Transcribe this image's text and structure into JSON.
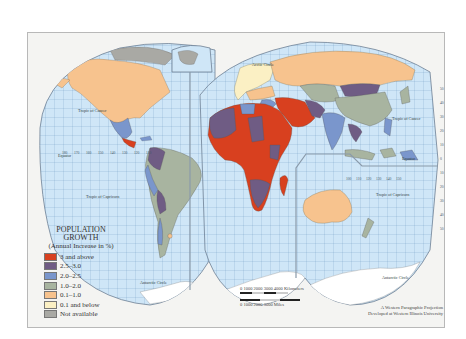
{
  "map": {
    "projection_credit": [
      "A Western Paragraphic Projection",
      "Developed at Western Illinois University"
    ],
    "colors": {
      "ocean": "#cfe6f7",
      "grid": "#6a95c0",
      "frame": "#b8b8b8",
      "not_available": "#a9a9a4",
      "3_and_above": "#d8401f",
      "2.5_3.0": "#6f5c84",
      "2.0_2.5": "#7a96cc",
      "1.0_2.0": "#a8b4a0",
      "0.1_1.0": "#f7c38e",
      "0.1_and_below": "#fbf0c4"
    },
    "labels": {
      "tropic_cancer_west": "Tropic of Cancer",
      "tropic_capricorn_west": "Tropic of Capricorn",
      "equator_west": "Equator",
      "antarctic_circle_west": "Antarctic Circle",
      "tropic_cancer_east": "Tropic of Cancer",
      "tropic_capricorn_east": "Tropic of Capricorn",
      "equator_east": "Equator",
      "antarctic_circle_east": "Antarctic Circle",
      "arctic_circle": "Arctic Circle"
    },
    "longitude_ticks_west": [
      "180",
      "170",
      "160",
      "150",
      "140",
      "130",
      "120",
      "110",
      "100",
      "90"
    ],
    "longitude_ticks_east": [
      "100",
      "110",
      "120",
      "130",
      "140",
      "150",
      "160",
      "170",
      "180"
    ],
    "latitude_ticks_right": [
      "50",
      "40",
      "30",
      "20",
      "10",
      "0",
      "10",
      "20",
      "30",
      "40",
      "50",
      "60",
      "70"
    ]
  },
  "legend": {
    "title_line1": "POPULATION",
    "title_line2": "GROWTH",
    "subtitle": "(Annual Increase in %)",
    "items": [
      {
        "label": "3 and above",
        "color": "#d8401f"
      },
      {
        "label": "2.5–3.0",
        "color": "#6f5c84"
      },
      {
        "label": "2.0–2.5",
        "color": "#7a96cc"
      },
      {
        "label": "1.0–2.0",
        "color": "#a8b4a0"
      },
      {
        "label": "0.1–1.0",
        "color": "#f7c38e"
      },
      {
        "label": "0.1 and below",
        "color": "#fbf0c4"
      },
      {
        "label": "Not available",
        "color": "#a9a9a4"
      }
    ]
  },
  "scale": {
    "km_label": "0    1000  2000  3000  4000 Kilometers",
    "miles_label": "0        1000       2000       3000 Miles"
  }
}
